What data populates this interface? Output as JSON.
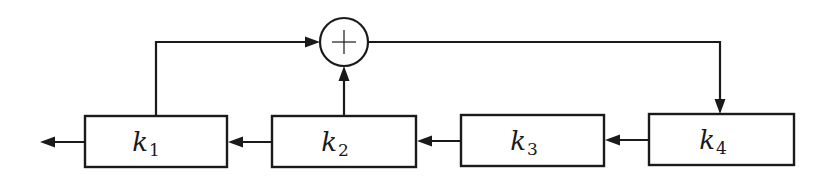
{
  "diagram": {
    "type": "shift-register-feedback",
    "blocks": [
      {
        "id": "k1",
        "base": "k",
        "subscript": "1"
      },
      {
        "id": "k2",
        "base": "k",
        "subscript": "2"
      },
      {
        "id": "k3",
        "base": "k",
        "subscript": "3"
      },
      {
        "id": "k4",
        "base": "k",
        "subscript": "4"
      }
    ],
    "summing_junction": {
      "symbol": "+"
    },
    "edges": [
      {
        "from": "k4",
        "to": "k3"
      },
      {
        "from": "k3",
        "to": "k2"
      },
      {
        "from": "k2",
        "to": "k1"
      },
      {
        "from": "k1",
        "to": "output"
      },
      {
        "from": "k1",
        "to": "sum"
      },
      {
        "from": "k2",
        "to": "sum"
      },
      {
        "from": "sum",
        "to": "k4"
      }
    ]
  }
}
